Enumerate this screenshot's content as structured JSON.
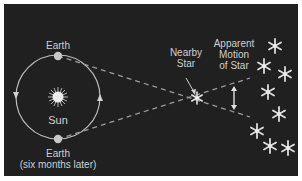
{
  "diagram": {
    "labels": {
      "earth_top": "Earth",
      "sun": "Sun",
      "earth_bottom_line1": "Earth",
      "earth_bottom_line2": "(six months later)",
      "nearby_star_line1": "Nearby",
      "nearby_star_line2": "Star",
      "apparent_line1": "Apparent",
      "apparent_line2": "Motion",
      "apparent_line3": "of Star"
    },
    "colors": {
      "background": "#202020",
      "border": "#ffffff",
      "text": "#cfcfcf",
      "orbit": "#bdbdbd",
      "planet": "#c8c8c8",
      "sun": "#e8e8e8",
      "star": "#dcdcdc",
      "dashed_line": "#9a9a9a"
    },
    "elements": {
      "orbit": {
        "cx": 65,
        "cy": 94,
        "r": 43
      },
      "earth_top": {
        "cx": 56,
        "cy": 55
      },
      "earth_bottom": {
        "cx": 56,
        "cy": 139
      },
      "sun": {
        "cx": 56,
        "cy": 96
      },
      "nearby_star": {
        "cx": 197,
        "cy": 98
      },
      "background_stars": [
        {
          "cx": 275,
          "cy": 46
        },
        {
          "cx": 264,
          "cy": 66
        },
        {
          "cx": 286,
          "cy": 74
        },
        {
          "cx": 268,
          "cy": 92
        },
        {
          "cx": 279,
          "cy": 114
        },
        {
          "cx": 257,
          "cy": 131
        },
        {
          "cx": 270,
          "cy": 146
        },
        {
          "cx": 288,
          "cy": 148
        }
      ]
    }
  }
}
